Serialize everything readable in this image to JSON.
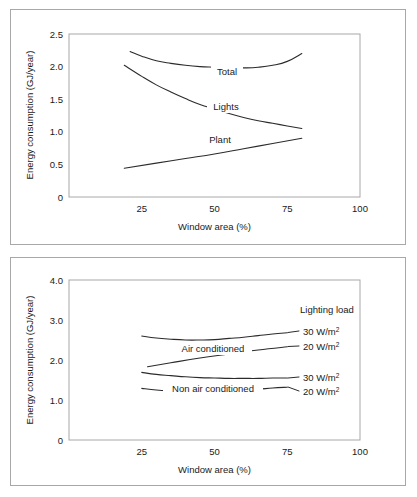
{
  "figure": {
    "panel_count": 2,
    "background_color": "#ffffff",
    "frame_color": "#a8a8a8",
    "curve_color": "#2b2b2b"
  },
  "chart_data": [
    {
      "id": "top",
      "type": "line",
      "title": "",
      "xlabel": "Window area (%)",
      "ylabel": "Energy consumption (GJ/year)",
      "xlim": [
        0,
        100
      ],
      "ylim": [
        0,
        2.5
      ],
      "xticks": [
        25,
        50,
        75,
        100
      ],
      "xticklabels": [
        "25",
        "50",
        "75",
        "100"
      ],
      "yticks": [
        0,
        0.5,
        1.0,
        1.5,
        2.0,
        2.5
      ],
      "yticklabels": [
        "0",
        "0.5",
        "1.0",
        "1.5",
        "2.0",
        "2.5"
      ],
      "grid": false,
      "legend": "inline-curve-labels",
      "series": [
        {
          "name": "Total",
          "label": "Total",
          "label_x": 55,
          "label_y": 2.12,
          "x": [
            21,
            25,
            30,
            35,
            40,
            45,
            50,
            55,
            60,
            65,
            70,
            75,
            80
          ],
          "y": [
            2.23,
            2.16,
            2.09,
            2.05,
            2.02,
            2.0,
            1.99,
            1.98,
            1.98,
            1.99,
            2.02,
            2.08,
            2.2
          ]
        },
        {
          "name": "Lights",
          "label": "Lights",
          "label_x": 54,
          "label_y": 1.52,
          "x": [
            19,
            25,
            30,
            35,
            40,
            45,
            50,
            55,
            60,
            65,
            70,
            75,
            80
          ],
          "y": [
            2.02,
            1.85,
            1.72,
            1.61,
            1.51,
            1.42,
            1.35,
            1.28,
            1.22,
            1.17,
            1.13,
            1.09,
            1.05
          ]
        },
        {
          "name": "Plant",
          "label": "Plant",
          "label_x": 52,
          "label_y": 1.02,
          "x": [
            19,
            30,
            40,
            50,
            60,
            70,
            80
          ],
          "y": [
            0.44,
            0.52,
            0.59,
            0.66,
            0.74,
            0.82,
            0.9
          ]
        }
      ]
    },
    {
      "id": "bottom",
      "type": "line",
      "title": "",
      "xlabel": "Window area (%)",
      "ylabel": "Energy consumption (GJ/year)",
      "xlim": [
        0,
        100
      ],
      "ylim": [
        0,
        4.0
      ],
      "xticks": [
        25,
        50,
        75,
        100
      ],
      "xticklabels": [
        "25",
        "50",
        "75",
        "100"
      ],
      "yticks": [
        0,
        1.0,
        2.0,
        3.0,
        4.0
      ],
      "yticklabels": [
        "0",
        "1.0",
        "2.0",
        "3.0",
        "4.0"
      ],
      "grid": false,
      "legend_heading": "Lighting load",
      "group_labels": [
        {
          "text": "Air conditioned",
          "x": 45,
          "y": 2.28
        },
        {
          "text": "Non air conditioned",
          "x": 45,
          "y": 1.3
        }
      ],
      "series": [
        {
          "name": "air-conditioned-30",
          "group": "Air conditioned",
          "legend_label": "30 W/m",
          "legend_sup": "2",
          "x": [
            25,
            30,
            35,
            40,
            45,
            50,
            55,
            60,
            65,
            70,
            75
          ],
          "y": [
            2.6,
            2.55,
            2.52,
            2.5,
            2.5,
            2.51,
            2.54,
            2.57,
            2.61,
            2.65,
            2.68
          ]
        },
        {
          "name": "air-conditioned-20",
          "group": "Air conditioned",
          "legend_label": "20 W/m",
          "legend_sup": "2",
          "x": [
            27,
            35,
            45,
            55,
            65,
            75
          ],
          "y": [
            1.83,
            1.93,
            2.05,
            2.15,
            2.25,
            2.33
          ]
        },
        {
          "name": "non-air-conditioned-30",
          "group": "Non air conditioned",
          "legend_label": "30 W/m",
          "legend_sup": "2",
          "x": [
            25,
            30,
            35,
            40,
            45,
            50,
            55,
            60,
            65,
            70,
            75
          ],
          "y": [
            1.69,
            1.64,
            1.61,
            1.58,
            1.56,
            1.55,
            1.54,
            1.54,
            1.54,
            1.55,
            1.55
          ]
        },
        {
          "name": "non-air-conditioned-20",
          "group": "Non air conditioned",
          "legend_label": "20 W/m",
          "legend_sup": "2",
          "x": [
            25,
            30,
            35,
            40,
            45,
            50,
            55,
            60,
            65,
            70,
            75
          ],
          "y": [
            1.29,
            1.25,
            1.23,
            1.22,
            1.22,
            1.22,
            1.23,
            1.25,
            1.27,
            1.3,
            1.32
          ]
        }
      ]
    }
  ],
  "top_chart": {
    "ylabel": "Energy consumption (GJ/year)",
    "xlabel": "Window area (%)",
    "yticks": [
      "2.5",
      "2.0",
      "1.5",
      "1.0",
      "0.5",
      "0"
    ],
    "xticks": [
      "25",
      "50",
      "75",
      "100"
    ],
    "curve_labels": {
      "total": "Total",
      "lights": "Lights",
      "plant": "Plant"
    }
  },
  "bottom_chart": {
    "ylabel": "Energy consumption (GJ/year)",
    "xlabel": "Window area (%)",
    "yticks": [
      "4.0",
      "3.0",
      "2.0",
      "1.0",
      "0"
    ],
    "xticks": [
      "25",
      "50",
      "75",
      "100"
    ],
    "legend_heading": "Lighting load",
    "legend_items": [
      {
        "value": "30 W/m",
        "sup": "2"
      },
      {
        "value": "20 W/m",
        "sup": "2"
      },
      {
        "value": "30 W/m",
        "sup": "2"
      },
      {
        "value": "20 W/m",
        "sup": "2"
      }
    ],
    "group_labels": {
      "air_conditioned": "Air conditioned",
      "non_air_conditioned": "Non air conditioned"
    }
  }
}
